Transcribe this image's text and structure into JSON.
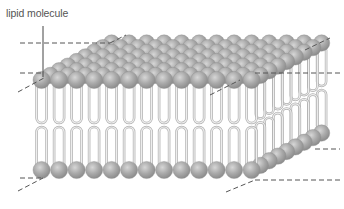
{
  "diagram": {
    "labels": [
      {
        "id": "lipid-molecule",
        "text": "lipid molecule"
      }
    ],
    "colors": {
      "head_fill": "#a9a9a9",
      "head_highlight": "#d2d2d2",
      "head_shadow": "#8a8a8a",
      "tail_stroke": "#b4b4b4",
      "tail_fill": "#e6e6e6",
      "dash_line": "#555555",
      "leader_line": "#444444"
    },
    "geometry": {
      "front_left_x": 33,
      "front_right_x": 250,
      "top_heads_y": 80,
      "bottom_heads_y": 170,
      "depth_dx": 70,
      "depth_dy": -37,
      "head_spacing": 17.5,
      "depth_rows": 8
    }
  }
}
